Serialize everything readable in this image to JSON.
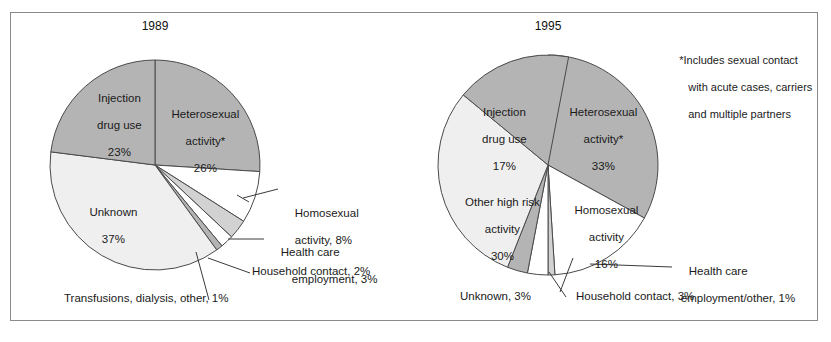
{
  "figure": {
    "title": "",
    "background": "#ffffff",
    "frame_color": "#8a8a8a"
  },
  "footnote": {
    "line1": "*Includes sexual contact",
    "line2": "with acute cases, carriers",
    "line3": "and multiple partners"
  },
  "colors": {
    "dark_gray": "#b4b4b4",
    "light_gray": "#efefef",
    "mid_gray": "#d2d2d2",
    "white": "#ffffff",
    "outline": "#4a4a4a",
    "text": "#1a1a1a"
  },
  "charts": {
    "left": {
      "title": "1989",
      "inside_labels": [
        {
          "name": "injection-drug-use",
          "line1": "Injection",
          "line2": "drug use",
          "line3": "23%"
        },
        {
          "name": "heterosexual-activity",
          "line1": "Heterosexual",
          "line2": "activity*",
          "line3": "26%"
        },
        {
          "name": "unknown",
          "line1": "Unknown",
          "line2": "37%",
          "line3": ""
        }
      ],
      "callouts": [
        {
          "name": "homosexual-activity",
          "line1": "Homosexual",
          "line2": "activity, 8%"
        },
        {
          "name": "health-care-employment",
          "line1": "Health care",
          "line2": "employment, 3%"
        },
        {
          "name": "household-contact",
          "line1": "Household contact, 2%",
          "line2": ""
        },
        {
          "name": "transfusions-dialysis-other",
          "line1": "Transfusions, dialysis, other, 1%",
          "line2": ""
        }
      ]
    },
    "right": {
      "title": "1995",
      "inside_labels": [
        {
          "name": "injection-drug-use",
          "line1": "Injection",
          "line2": "drug use",
          "line3": "17%"
        },
        {
          "name": "heterosexual-activity",
          "line1": "Heterosexual",
          "line2": "activity*",
          "line3": "33%"
        },
        {
          "name": "other-high-risk-activity",
          "line1": "Other high risk",
          "line2": "activity",
          "line3": "30%"
        },
        {
          "name": "homosexual-activity",
          "line1": "Homosexual",
          "line2": "activity",
          "line3": "16%"
        }
      ],
      "callouts": [
        {
          "name": "health-care-employment-other",
          "line1": "Health care",
          "line2": "employment/other, 1%"
        },
        {
          "name": "household-contact",
          "line1": "Household contact, 3%",
          "line2": ""
        },
        {
          "name": "unknown",
          "line1": "Unknown, 3%",
          "line2": ""
        }
      ]
    }
  },
  "chart_data": [
    {
      "type": "pie",
      "title": "1989",
      "id": "pie-1989",
      "total": 100,
      "unit": "percent",
      "legend": "inside-slice-labels-and-callouts",
      "start_angle_deg": 0,
      "direction": "clockwise",
      "slices": [
        {
          "label": "Heterosexual activity*",
          "value": 26,
          "color": "#b4b4b4"
        },
        {
          "label": "Homosexual activity",
          "value": 8,
          "color": "#ffffff"
        },
        {
          "label": "Health care employment",
          "value": 3,
          "color": "#d2d2d2"
        },
        {
          "label": "Household contact",
          "value": 2,
          "color": "#ffffff"
        },
        {
          "label": "Transfusions, dialysis, other",
          "value": 1,
          "color": "#b4b4b4"
        },
        {
          "label": "Unknown",
          "value": 37,
          "color": "#efefef"
        },
        {
          "label": "Injection drug use",
          "value": 23,
          "color": "#b4b4b4"
        }
      ]
    },
    {
      "type": "pie",
      "title": "1995",
      "id": "pie-1995",
      "total": 100,
      "unit": "percent",
      "legend": "inside-slice-labels-and-callouts",
      "start_angle_deg": 0,
      "direction": "clockwise",
      "slices": [
        {
          "label": "Heterosexual activity*",
          "value": 33,
          "color": "#b4b4b4"
        },
        {
          "label": "Homosexual activity",
          "value": 16,
          "color": "#ffffff"
        },
        {
          "label": "Health care employment/other",
          "value": 1,
          "color": "#d2d2d2"
        },
        {
          "label": "Household contact",
          "value": 3,
          "color": "#ffffff"
        },
        {
          "label": "Unknown",
          "value": 3,
          "color": "#b4b4b4"
        },
        {
          "label": "Other high risk activity",
          "value": 30,
          "color": "#efefef"
        },
        {
          "label": "Injection drug use",
          "value": 17,
          "color": "#b4b4b4"
        }
      ],
      "footnote": "*Includes sexual contact with acute cases, carriers and multiple partners"
    }
  ]
}
